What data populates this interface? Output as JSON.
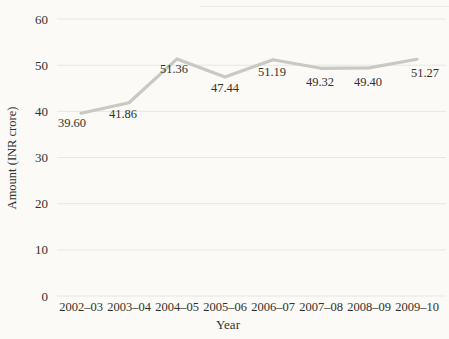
{
  "figure": {
    "background": "#fbfaf7"
  },
  "chart_data": {
    "type": "line",
    "title": "",
    "xlabel": "Year",
    "ylabel": "Amount (INR crore)",
    "categories": [
      "2002–03",
      "2003–04",
      "2004–05",
      "2005–06",
      "2006–07",
      "2007–08",
      "2008–09",
      "2009–10"
    ],
    "values": [
      39.6,
      41.86,
      51.36,
      47.44,
      51.19,
      49.32,
      49.4,
      51.27
    ],
    "data_labels": [
      "39.60",
      "41.86",
      "51.36",
      "47.44",
      "51.19",
      "49.32",
      "49.40",
      "51.27"
    ],
    "ylim": [
      0,
      60
    ],
    "yticks": [
      0,
      10,
      20,
      30,
      40,
      50,
      60
    ],
    "grid": "horizontal",
    "legend": "none",
    "line_color": "#c9c9c3",
    "grid_color": "#e7e6e1",
    "text_color": "#34312b",
    "label_offsets": {
      "dx": [
        -9,
        -6,
        -3,
        0,
        -1,
        -1,
        -1,
        8
      ],
      "dy": [
        14,
        15,
        14,
        15,
        16,
        18,
        18,
        18
      ]
    }
  }
}
